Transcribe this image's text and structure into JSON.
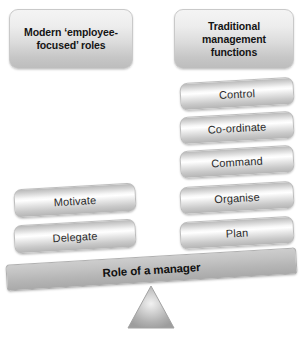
{
  "diagram": {
    "title_text": "Role of a manager",
    "type": "balance-scale-seesaw",
    "headers": {
      "left": "Modern ‘employee-\nfocused’ roles",
      "right": "Traditional\nmanagement\nfunctions"
    },
    "left_items": [
      {
        "label": "Motivate"
      },
      {
        "label": "Delegate"
      }
    ],
    "right_items": [
      {
        "label": "Control"
      },
      {
        "label": "Co-ordinate"
      },
      {
        "label": "Command"
      },
      {
        "label": "Organise"
      },
      {
        "label": "Plan"
      }
    ],
    "fulcrum": {
      "shape": "triangle-icon"
    },
    "colors": {
      "background": "#ffffff",
      "bar_light": "#ffffff",
      "bar_mid": "#cfcfcf",
      "bar_dark": "#b4b4b4",
      "plank": "#bcbcbc",
      "fulcrum": "#a8a8a8",
      "text": "#2b2b2b",
      "heading_text": "#141414",
      "border": "#bdbdbd"
    }
  }
}
